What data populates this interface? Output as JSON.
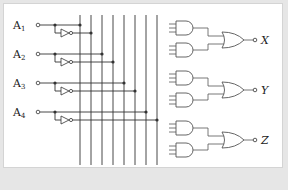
{
  "diagram": {
    "type": "logic-circuit",
    "inputs": [
      {
        "label": "A",
        "sub": "1",
        "y": 25
      },
      {
        "label": "A",
        "sub": "2",
        "y": 54
      },
      {
        "label": "A",
        "sub": "3",
        "y": 83
      },
      {
        "label": "A",
        "sub": "4",
        "y": 112
      }
    ],
    "bus_lines_x": [
      80,
      91,
      102,
      113,
      124,
      135,
      146,
      157
    ],
    "and_gates_y": [
      28,
      50,
      78,
      100,
      128,
      150
    ],
    "or_gates": [
      {
        "output": "X",
        "y": 40
      },
      {
        "output": "Y",
        "y": 90
      },
      {
        "output": "Z",
        "y": 140
      }
    ],
    "colors": {
      "line": "#333333",
      "gate": "#555555",
      "background": "#ffffff",
      "frame": "#e6e6e6"
    }
  }
}
